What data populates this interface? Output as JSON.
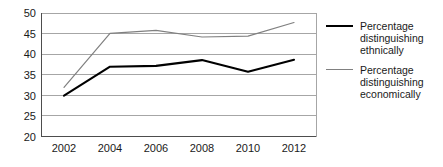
{
  "chart_data": {
    "type": "line",
    "title": "",
    "xlabel": "",
    "ylabel": "",
    "categories": [
      "2002",
      "2004",
      "2006",
      "2008",
      "2010",
      "2012"
    ],
    "x": [
      2002,
      2004,
      2006,
      2008,
      2010,
      2012
    ],
    "xlim": [
      2001,
      2013
    ],
    "ylim": [
      20,
      50
    ],
    "yticks": [
      20,
      25,
      30,
      35,
      40,
      45,
      50
    ],
    "ytick_labels": [
      "20",
      "25",
      "30",
      "35",
      "40",
      "45",
      "50"
    ],
    "grid": "horizontal",
    "legend_position": "right",
    "series": [
      {
        "name": "Percentage distinguishing ethnically",
        "color": "#000000",
        "line_width": 2,
        "values": [
          30.0,
          37.0,
          37.2,
          38.6,
          35.8,
          38.7
        ]
      },
      {
        "name": "Percentage distinguishing economically",
        "color": "#808080",
        "line_width": 1,
        "values": [
          32.0,
          45.1,
          45.8,
          44.2,
          44.4,
          47.7
        ]
      }
    ]
  },
  "axes": {
    "y_tick_labels": [
      "50",
      "45",
      "40",
      "35",
      "30",
      "25",
      "20"
    ],
    "x_tick_labels": [
      "2002",
      "2004",
      "2006",
      "2008",
      "2010",
      "2012"
    ]
  },
  "legend": {
    "items": [
      {
        "swatch": "black-thick-line",
        "lines": [
          "Percentage",
          "distinguishing",
          "ethnically"
        ]
      },
      {
        "swatch": "gray-thin-line",
        "lines": [
          "Percentage",
          "distinguishing",
          "economically"
        ]
      }
    ]
  },
  "colors": {
    "series_ethnic": "#000000",
    "series_economic": "#808080",
    "grid": "#a6a6a6",
    "axis": "#4d4d4d",
    "background": "#ffffff",
    "text": "#1a1a1a"
  }
}
